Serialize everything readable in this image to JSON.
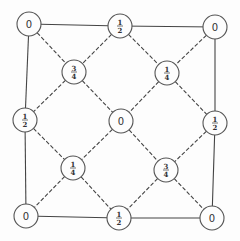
{
  "diagram": {
    "type": "lattice-graph",
    "nodes": [
      {
        "id": "n_tl",
        "label": "0",
        "num": null,
        "den": null,
        "x": 29,
        "y": 24
      },
      {
        "id": "n_tm",
        "label": "1/2",
        "num": "1",
        "den": "2",
        "x": 120,
        "y": 26
      },
      {
        "id": "n_tr",
        "label": "0",
        "num": null,
        "den": null,
        "x": 215,
        "y": 27
      },
      {
        "id": "n_ul",
        "label": "3/4",
        "num": "3",
        "den": "4",
        "x": 74,
        "y": 72
      },
      {
        "id": "n_ur",
        "label": "1/4",
        "num": "1",
        "den": "4",
        "x": 167,
        "y": 73
      },
      {
        "id": "n_ml",
        "label": "1/2",
        "num": "1",
        "den": "2",
        "x": 25,
        "y": 120
      },
      {
        "id": "n_c",
        "label": "0",
        "num": null,
        "den": null,
        "x": 121,
        "y": 121
      },
      {
        "id": "n_mr",
        "label": "1/2",
        "num": "1",
        "den": "2",
        "x": 215,
        "y": 123
      },
      {
        "id": "n_ll",
        "label": "1/4",
        "num": "1",
        "den": "4",
        "x": 73,
        "y": 168
      },
      {
        "id": "n_lr",
        "label": "3/4",
        "num": "3",
        "den": "4",
        "x": 166,
        "y": 170
      },
      {
        "id": "n_bl",
        "label": "0",
        "num": null,
        "den": null,
        "x": 26,
        "y": 216
      },
      {
        "id": "n_bm",
        "label": "1/2",
        "num": "1",
        "den": "2",
        "x": 119,
        "y": 218
      },
      {
        "id": "n_br",
        "label": "0",
        "num": null,
        "den": null,
        "x": 212,
        "y": 218
      }
    ],
    "edges_solid": [
      [
        "n_tl",
        "n_tm"
      ],
      [
        "n_tm",
        "n_tr"
      ],
      [
        "n_tr",
        "n_mr"
      ],
      [
        "n_mr",
        "n_br"
      ],
      [
        "n_br",
        "n_bm"
      ],
      [
        "n_bm",
        "n_bl"
      ],
      [
        "n_bl",
        "n_ml"
      ],
      [
        "n_ml",
        "n_tl"
      ]
    ],
    "edges_dashed": [
      [
        "n_tl",
        "n_ul"
      ],
      [
        "n_ul",
        "n_c"
      ],
      [
        "n_c",
        "n_lr"
      ],
      [
        "n_lr",
        "n_br"
      ],
      [
        "n_tr",
        "n_ur"
      ],
      [
        "n_ur",
        "n_c"
      ],
      [
        "n_c",
        "n_ll"
      ],
      [
        "n_ll",
        "n_bl"
      ],
      [
        "n_tm",
        "n_ul"
      ],
      [
        "n_ul",
        "n_ml"
      ],
      [
        "n_tm",
        "n_ur"
      ],
      [
        "n_ur",
        "n_mr"
      ],
      [
        "n_ml",
        "n_ll"
      ],
      [
        "n_ll",
        "n_bm"
      ],
      [
        "n_mr",
        "n_lr"
      ],
      [
        "n_lr",
        "n_bm"
      ]
    ],
    "node_radius": 12,
    "colors": {
      "stroke": "#444444",
      "background": "#fdfdfd",
      "text": "#333333"
    }
  }
}
